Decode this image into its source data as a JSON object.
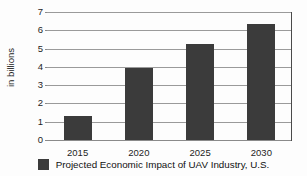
{
  "chart_data": {
    "type": "bar",
    "title": "",
    "xlabel": "",
    "ylabel": "in billions",
    "categories": [
      "2015",
      "2020",
      "2025",
      "2030"
    ],
    "values": [
      1.3,
      3.95,
      5.25,
      6.35
    ],
    "series": [
      {
        "name": "Projected Economic Impact of UAV Industry, U.S.",
        "values": [
          1.3,
          3.95,
          5.25,
          6.35
        ],
        "color": "#3b3b3b"
      }
    ],
    "ylim": [
      0,
      7
    ],
    "ytick_labels": [
      "0",
      "1",
      "2",
      "3",
      "4",
      "5",
      "6",
      "7"
    ],
    "ytick_values": [
      0,
      1,
      2,
      3,
      4,
      5,
      6,
      7
    ],
    "grid": true,
    "legend_position": "bottom"
  },
  "legend": {
    "entries": [
      {
        "label": "Projected Economic Impact of UAV Industry, U.S.",
        "color": "#3b3b3b"
      }
    ]
  },
  "colors": {
    "bar": "#3b3b3b",
    "grid": "#9a9a9a",
    "axis": "#4a4a4a",
    "text": "#1d1d1d",
    "background": "#fdfdfd"
  }
}
